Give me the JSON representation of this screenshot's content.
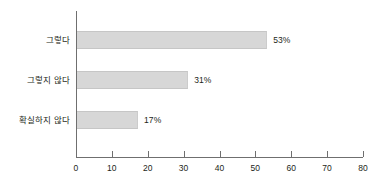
{
  "chart_data": {
    "type": "bar",
    "orientation": "horizontal",
    "title": "",
    "subtitle": "",
    "xlabel": "",
    "ylabel": "",
    "categories": [
      "그렇다",
      "그렇지 않다",
      "확실하지 않다"
    ],
    "values": [
      53,
      31,
      17
    ],
    "value_labels": [
      "53%",
      "31%",
      "17%"
    ],
    "xlim": [
      0,
      80
    ],
    "xticks": [
      0,
      10,
      20,
      30,
      40,
      50,
      60,
      70,
      80
    ],
    "xtick_labels": [
      "0",
      "10",
      "20",
      "30",
      "40",
      "50",
      "60",
      "70",
      "80"
    ],
    "grid": false,
    "legend": false,
    "bar_color": "#d7d7d7",
    "axis_color": "#6f6f6f",
    "text_color": "#231f20",
    "background": "#ffffff"
  }
}
